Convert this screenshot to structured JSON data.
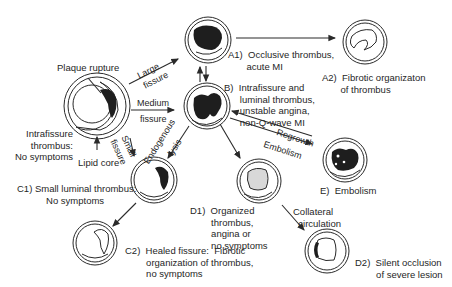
{
  "diagram": {
    "colors": {
      "line": "#2a2a2a",
      "thrombus": "#1e1e1e",
      "organized": "#d8d8d8",
      "background": "#ffffff"
    },
    "nodes": {
      "origin": {
        "label_top": "Plaque rupture",
        "label_left": "Intrafissure\nthrombus:\nNo symptoms",
        "label_bottom": "Lipid core"
      },
      "A1": {
        "label": "A1)  Occlusive thrombus,\n       acute MI"
      },
      "A2": {
        "label": "A2)  Fibrotic organizaton\n       of thrombus"
      },
      "B": {
        "label": "B)  Intrafissure and\n      luminal thrombus,\n      unstable angina,\n      non-Q-wave MI"
      },
      "C1": {
        "label": "C1) Small luminal thrombus:\n           No symptoms"
      },
      "C2": {
        "label": "C2)  Healed fissure:  Fibrotic\n        organization of thrombus,\n        no symptoms"
      },
      "D1": {
        "label": "D1)  Organized\n        thrombus,\n        angina or\n        no symptoms"
      },
      "D2": {
        "label": "D2)  Silent occlusion\n        of severe lesion"
      },
      "E": {
        "label": "E)  Embolism"
      }
    },
    "edges": {
      "large_fissure": [
        "Large",
        "fissure"
      ],
      "medium_fissure": [
        "Medium",
        "fissure"
      ],
      "small_fissure": [
        "Small",
        "fissure"
      ],
      "endogenous_lysis": [
        "Endogenous",
        "lysis"
      ],
      "regrowth": "Regrowth",
      "embolism": "Embolism",
      "collateral": "Collateral\n  circulation"
    }
  }
}
